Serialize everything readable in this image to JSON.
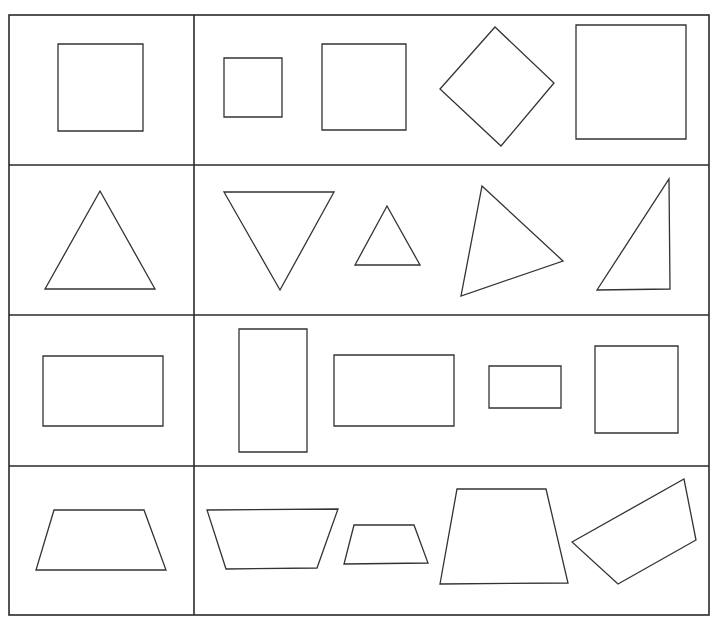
{
  "worksheet": {
    "stroke_color": "#333333",
    "background": "#ffffff",
    "grid": {
      "left": 9,
      "top": 15,
      "right": 709,
      "bottom": 615,
      "column_divider_x": 194,
      "row_dividers_y": [
        165,
        315,
        466
      ]
    },
    "rows": [
      {
        "category": "square",
        "reference": {
          "kind": "square",
          "points": [
            [
              58,
              44
            ],
            [
              143,
              44
            ],
            [
              143,
              131
            ],
            [
              58,
              131
            ]
          ]
        },
        "options": [
          {
            "kind": "small-square",
            "points": [
              [
                224,
                58
              ],
              [
                282,
                58
              ],
              [
                282,
                117
              ],
              [
                224,
                117
              ]
            ]
          },
          {
            "kind": "square",
            "points": [
              [
                322,
                44
              ],
              [
                406,
                44
              ],
              [
                406,
                130
              ],
              [
                322,
                130
              ]
            ]
          },
          {
            "kind": "rotated-square",
            "points": [
              [
                495,
                27
              ],
              [
                554,
                83
              ],
              [
                501,
                146
              ],
              [
                440,
                89
              ]
            ]
          },
          {
            "kind": "large-square",
            "points": [
              [
                576,
                25
              ],
              [
                686,
                25
              ],
              [
                686,
                139
              ],
              [
                576,
                139
              ]
            ]
          }
        ]
      },
      {
        "category": "triangle",
        "reference": {
          "kind": "equilateral-triangle",
          "points": [
            [
              100,
              191
            ],
            [
              155,
              289
            ],
            [
              45,
              289
            ]
          ]
        },
        "options": [
          {
            "kind": "inverted-triangle",
            "points": [
              [
                224,
                192
              ],
              [
                334,
                192
              ],
              [
                280,
                290
              ]
            ]
          },
          {
            "kind": "small-triangle",
            "points": [
              [
                387,
                206
              ],
              [
                420,
                265
              ],
              [
                355,
                265
              ]
            ]
          },
          {
            "kind": "scalene-triangle",
            "points": [
              [
                482,
                186
              ],
              [
                563,
                261
              ],
              [
                461,
                296
              ]
            ]
          },
          {
            "kind": "right-triangle",
            "points": [
              [
                669,
                179
              ],
              [
                670,
                289
              ],
              [
                597,
                290
              ]
            ]
          }
        ]
      },
      {
        "category": "rectangle",
        "reference": {
          "kind": "rectangle",
          "points": [
            [
              43,
              356
            ],
            [
              163,
              356
            ],
            [
              163,
              426
            ],
            [
              43,
              426
            ]
          ]
        },
        "options": [
          {
            "kind": "tall-rectangle",
            "points": [
              [
                239,
                329
              ],
              [
                307,
                329
              ],
              [
                307,
                452
              ],
              [
                239,
                452
              ]
            ]
          },
          {
            "kind": "rectangle",
            "points": [
              [
                334,
                355
              ],
              [
                454,
                355
              ],
              [
                454,
                426
              ],
              [
                334,
                426
              ]
            ]
          },
          {
            "kind": "small-rectangle",
            "points": [
              [
                489,
                366
              ],
              [
                561,
                366
              ],
              [
                561,
                408
              ],
              [
                489,
                408
              ]
            ]
          },
          {
            "kind": "square-like",
            "points": [
              [
                595,
                346
              ],
              [
                678,
                346
              ],
              [
                678,
                433
              ],
              [
                595,
                433
              ]
            ]
          }
        ]
      },
      {
        "category": "trapezoid",
        "reference": {
          "kind": "trapezoid",
          "points": [
            [
              54,
              510
            ],
            [
              144,
              510
            ],
            [
              166,
              570
            ],
            [
              36,
              570
            ]
          ]
        },
        "options": [
          {
            "kind": "inverted-trapezoid",
            "points": [
              [
                207,
                510
              ],
              [
                338,
                509
              ],
              [
                317,
                568
              ],
              [
                226,
                569
              ]
            ]
          },
          {
            "kind": "small-trapezoid",
            "points": [
              [
                354,
                525
              ],
              [
                414,
                525
              ],
              [
                428,
                563
              ],
              [
                344,
                564
              ]
            ]
          },
          {
            "kind": "tall-trapezoid",
            "points": [
              [
                457,
                489
              ],
              [
                546,
                489
              ],
              [
                568,
                583
              ],
              [
                440,
                584
              ]
            ]
          },
          {
            "kind": "rotated-quadrilateral",
            "points": [
              [
                572,
                542
              ],
              [
                684,
                479
              ],
              [
                696,
                540
              ],
              [
                618,
                584
              ]
            ]
          }
        ]
      }
    ]
  }
}
